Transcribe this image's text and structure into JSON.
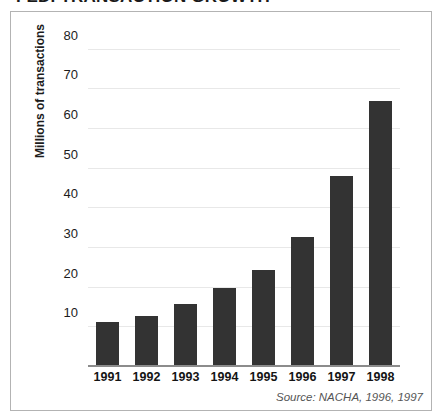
{
  "figure": {
    "title": "FEDI TRANSACTION GROWTH",
    "source_note": "Source: NACHA, 1996, 1997",
    "bar_color": "#333333",
    "grid_color": "#e8e8e8",
    "axis_color": "#8c8c8c",
    "frame_color": "#b3b3b3",
    "background": "#ffffff"
  },
  "chart_data": {
    "type": "bar",
    "title": "FEDI TRANSACTION GROWTH",
    "subtitle": "",
    "xlabel": "",
    "ylabel": "Millions of transactions",
    "categories": [
      "1991",
      "1992",
      "1993",
      "1994",
      "1995",
      "1996",
      "1997",
      "1998"
    ],
    "values": [
      11,
      12.5,
      15.5,
      19.5,
      24,
      32.5,
      48,
      67
    ],
    "series": [
      {
        "name": "FEDI transactions",
        "values": [
          11,
          12.5,
          15.5,
          19.5,
          24,
          32.5,
          48,
          67
        ]
      }
    ],
    "ylim": [
      0,
      85
    ],
    "yticks": [
      10,
      20,
      30,
      40,
      50,
      60,
      70,
      80
    ],
    "ytick_labels": [
      "10",
      "20",
      "30",
      "40",
      "50",
      "60",
      "70",
      "80"
    ],
    "xtick_labels": [
      "1991",
      "1992",
      "1993",
      "1994",
      "1995",
      "1996",
      "1997",
      "1998"
    ],
    "grid": true,
    "grid_axis": "y",
    "legend": false,
    "legend_position": "none",
    "annotations": [
      "Source: NACHA, 1996, 1997"
    ]
  }
}
